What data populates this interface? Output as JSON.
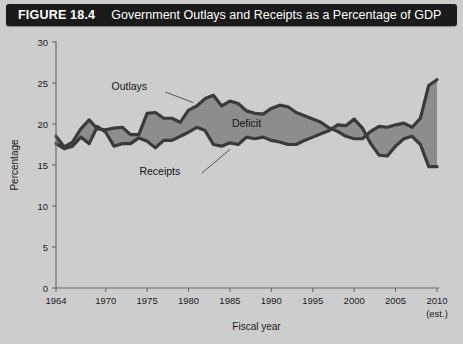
{
  "header": {
    "figure_number": "FIGURE 18.4",
    "title": "Government Outlays and Receipts as a Percentage of GDP",
    "bar_color": "#1b1b1b",
    "text_color": "#ffffff"
  },
  "labels": {
    "outlays": "Outlays",
    "receipts": "Receipts",
    "deficit": "Deficit"
  },
  "background_color": "#cdcdcd",
  "chart_data": {
    "type": "area",
    "title": "Government Outlays and Receipts as a Percentage of GDP",
    "xlabel": "Fiscal year",
    "ylabel": "Percentage",
    "xlim": [
      1964,
      2010
    ],
    "ylim": [
      0,
      30
    ],
    "yticks": [
      0,
      5,
      10,
      15,
      20,
      25,
      30
    ],
    "xticks": [
      1964,
      1970,
      1975,
      1980,
      1985,
      1990,
      1995,
      2000,
      2005,
      2010
    ],
    "xtick_labels": [
      "1964",
      "1970",
      "1975",
      "1980",
      "1985",
      "1990",
      "1995",
      "2000",
      "2005",
      "2010"
    ],
    "xtick_note": "(est.)",
    "grid": false,
    "legend": "inline-annotations",
    "band_label": "Deficit",
    "band_color": "#8d8d8d",
    "line_color": "#3a3a3a",
    "x": [
      1964,
      1965,
      1966,
      1967,
      1968,
      1969,
      1970,
      1971,
      1972,
      1973,
      1974,
      1975,
      1976,
      1977,
      1978,
      1979,
      1980,
      1981,
      1982,
      1983,
      1984,
      1985,
      1986,
      1987,
      1988,
      1989,
      1990,
      1991,
      1992,
      1993,
      1994,
      1995,
      1996,
      1997,
      1998,
      1999,
      2000,
      2001,
      2002,
      2003,
      2004,
      2005,
      2006,
      2007,
      2008,
      2009,
      2010
    ],
    "series": [
      {
        "name": "Outlays",
        "values": [
          18.5,
          17.2,
          17.8,
          19.4,
          20.5,
          19.4,
          19.3,
          19.5,
          19.6,
          18.7,
          18.7,
          21.3,
          21.4,
          20.7,
          20.7,
          20.2,
          21.7,
          22.2,
          23.1,
          23.5,
          22.2,
          22.8,
          22.5,
          21.6,
          21.3,
          21.2,
          21.9,
          22.3,
          22.1,
          21.4,
          21.0,
          20.6,
          20.2,
          19.5,
          19.1,
          18.5,
          18.2,
          18.2,
          19.1,
          19.7,
          19.6,
          19.9,
          20.1,
          19.6,
          20.7,
          24.7,
          25.4
        ]
      },
      {
        "name": "Receipts",
        "values": [
          17.6,
          17.0,
          17.3,
          18.4,
          17.6,
          19.7,
          19.0,
          17.3,
          17.6,
          17.6,
          18.3,
          17.9,
          17.1,
          18.0,
          18.0,
          18.5,
          19.0,
          19.6,
          19.2,
          17.5,
          17.3,
          17.7,
          17.5,
          18.4,
          18.2,
          18.4,
          18.0,
          17.8,
          17.5,
          17.5,
          18.0,
          18.4,
          18.8,
          19.2,
          19.9,
          19.8,
          20.6,
          19.5,
          17.6,
          16.2,
          16.1,
          17.3,
          18.2,
          18.5,
          17.5,
          14.8,
          14.8
        ]
      }
    ],
    "annotations": [
      {
        "text": "Outlays",
        "x": 1975,
        "y": 24.2
      },
      {
        "text": "Receipts",
        "x": 1979,
        "y": 13.8
      },
      {
        "text": "Deficit",
        "x": 1987,
        "y": 19.6
      }
    ]
  }
}
